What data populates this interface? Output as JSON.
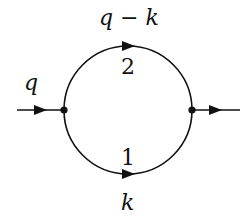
{
  "diagram": {
    "type": "feynman-diagram-one-loop",
    "colors": {
      "ink": "#111111",
      "background": "#ffffff"
    },
    "external_lines": {
      "incoming": {
        "label": "q"
      },
      "outgoing": {
        "label": ""
      }
    },
    "propagators": [
      {
        "index": "2",
        "momentum": "q − k",
        "position": "top"
      },
      {
        "index": "1",
        "momentum": "k",
        "position": "bottom"
      }
    ],
    "vertices": [
      {
        "name": "left-vertex"
      },
      {
        "name": "right-vertex"
      }
    ]
  }
}
